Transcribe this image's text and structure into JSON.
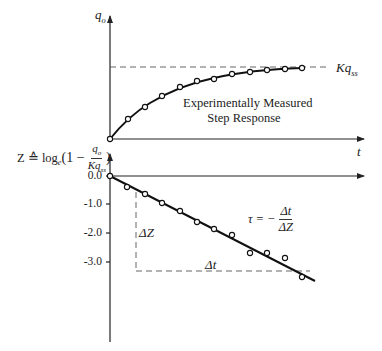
{
  "upper_plot": {
    "y_axis_label": "q",
    "y_axis_label_sub": "o",
    "x_axis_label": "t",
    "asymptote_label": "Kq",
    "asymptote_label_sub": "ss",
    "curve_caption_line1": "Experimentally Measured",
    "curve_caption_line2": "Step Response",
    "points_px": [
      [
        110,
        139
      ],
      [
        128,
        119
      ],
      [
        145,
        107
      ],
      [
        162,
        96
      ],
      [
        180,
        87
      ],
      [
        197,
        81
      ],
      [
        214,
        79
      ],
      [
        232,
        74
      ],
      [
        250,
        72
      ],
      [
        267,
        70
      ],
      [
        285,
        69
      ],
      [
        302,
        68
      ]
    ]
  },
  "lower_plot": {
    "y_axis_label_prefix": "Z ≙ log",
    "y_axis_label_log_base": "e",
    "y_axis_label_open": "(1 −",
    "y_axis_label_num": "q",
    "y_axis_label_num_sub": "o",
    "y_axis_label_den": "Kq",
    "y_axis_label_den_sub": "ss",
    "y_axis_label_close": ")",
    "ticks": [
      "0.0",
      "-1.0",
      "-2.0",
      "-3.0"
    ],
    "delta_z_label": "ΔZ",
    "delta_t_label": "Δt",
    "tau_label": "τ = −",
    "tau_num": "Δt",
    "tau_den": "ΔZ",
    "points_px": [
      [
        110,
        176
      ],
      [
        127,
        187
      ],
      [
        145,
        194
      ],
      [
        162,
        203
      ],
      [
        180,
        211
      ],
      [
        197,
        222
      ],
      [
        214,
        229
      ],
      [
        232,
        235
      ],
      [
        250,
        253
      ],
      [
        267,
        253
      ],
      [
        285,
        258
      ],
      [
        302,
        277
      ]
    ]
  },
  "chart_data": [
    {
      "type": "line",
      "title": "Experimentally Measured Step Response",
      "xlabel": "t",
      "ylabel": "q_o",
      "annotations": [
        "Kq_ss (steady-state asymptote, dashed)"
      ],
      "x": [
        0,
        1,
        2,
        3,
        4,
        5,
        6,
        7,
        8,
        9,
        10,
        11
      ],
      "series": [
        {
          "name": "q_o (normalized to Kq_ss)",
          "values": [
            0.0,
            0.28,
            0.45,
            0.61,
            0.73,
            0.82,
            0.85,
            0.92,
            0.95,
            0.96,
            0.99,
            1.0
          ]
        }
      ],
      "grid": false
    },
    {
      "type": "scatter",
      "title": "",
      "xlabel": "t",
      "ylabel": "Z ≙ log_e(1 − q_o/Kq_ss)",
      "yticks": [
        0.0,
        -1.0,
        -2.0,
        -3.0
      ],
      "ylim": [
        -5.7,
        0.0
      ],
      "x": [
        0,
        1,
        2,
        3,
        4,
        5,
        6,
        7,
        8,
        9,
        10,
        11
      ],
      "series": [
        {
          "name": "Z",
          "values": [
            0.0,
            -0.38,
            -0.62,
            -0.93,
            -1.21,
            -1.6,
            -1.84,
            -2.05,
            -2.67,
            -2.67,
            -2.84,
            -3.5
          ]
        }
      ],
      "fit_line": {
        "from": [
          0,
          0.0
        ],
        "to": [
          11.8,
          -3.6
        ]
      },
      "annotations": [
        "ΔZ",
        "Δt",
        "τ = −Δt/ΔZ"
      ],
      "grid": false
    }
  ]
}
